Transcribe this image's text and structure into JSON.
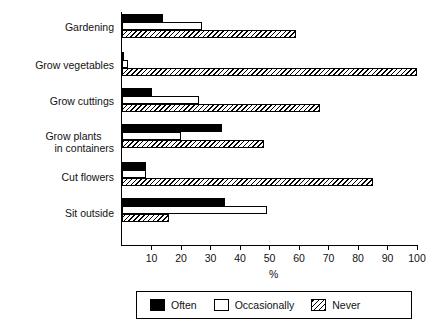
{
  "chart_data": {
    "type": "bar",
    "orientation": "horizontal",
    "title": "",
    "subtitle": "",
    "xlabel": "%",
    "ylabel": "",
    "xlim": [
      0,
      100
    ],
    "xticks": [
      0,
      10,
      20,
      30,
      40,
      50,
      60,
      70,
      80,
      90,
      100
    ],
    "xticklabels": [
      "",
      "10",
      "20",
      "30",
      "40",
      "50",
      "60",
      "70",
      "80",
      "90",
      "100"
    ],
    "grid": false,
    "legend_position": "bottom",
    "categories": [
      "Gardening",
      "Grow vegetables",
      "Grow plants in containers",
      "Grow cuttings",
      "Cut flowers",
      "Sit outside"
    ],
    "series": [
      {
        "name": "Often",
        "color": "#000000",
        "fill": "solid",
        "values": [
          14,
          0.5,
          10,
          34,
          8,
          35
        ]
      },
      {
        "name": "Occasionally",
        "color": "#ffffff",
        "fill": "empty",
        "values": [
          27,
          2,
          26,
          20,
          8,
          49
        ]
      },
      {
        "name": "Never",
        "color": "#000000",
        "fill": "hatch",
        "values": [
          59,
          100,
          67,
          48,
          85,
          16
        ]
      }
    ]
  },
  "categories_display": [
    {
      "line1": "Gardening",
      "line2": ""
    },
    {
      "line1": "Grow vegetables",
      "line2": ""
    },
    {
      "line1": "Grow cuttings",
      "line2": ""
    },
    {
      "line1": "Grow plants",
      "line2": "in containers"
    },
    {
      "line1": "Cut flowers",
      "line2": ""
    },
    {
      "line1": "Sit outside",
      "line2": ""
    }
  ],
  "groups": [
    {
      "label": "Gardening",
      "often": 14,
      "occasionally": 27,
      "never": 59
    },
    {
      "label": "Grow vegetables",
      "often": 0.5,
      "occasionally": 2,
      "never": 100
    },
    {
      "label": "Grow cuttings",
      "often": 10,
      "occasionally": 26,
      "never": 67
    },
    {
      "label": "Grow plants in containers",
      "often": 34,
      "occasionally": 20,
      "never": 48
    },
    {
      "label": "Cut flowers",
      "often": 8,
      "occasionally": 8,
      "never": 85
    },
    {
      "label": "Sit outside",
      "often": 35,
      "occasionally": 49,
      "never": 16
    }
  ],
  "axis": {
    "xlabel": "%",
    "ticks": [
      "10",
      "20",
      "30",
      "40",
      "50",
      "60",
      "70",
      "80",
      "90",
      "100"
    ],
    "tick_values": [
      10,
      20,
      30,
      40,
      50,
      60,
      70,
      80,
      90,
      100
    ]
  },
  "legend": {
    "items": [
      {
        "label": "Often",
        "swatch": "solid-black-swatch"
      },
      {
        "label": "Occasionally",
        "swatch": "empty-white-swatch"
      },
      {
        "label": "Never",
        "swatch": "hatched-swatch"
      }
    ]
  }
}
